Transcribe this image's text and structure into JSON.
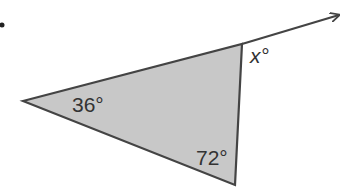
{
  "diagram": {
    "type": "triangle-exterior-angle",
    "fill_color": "#c8c8c8",
    "stroke_color": "#444444",
    "vertices": {
      "left": [
        23,
        101
      ],
      "top": [
        242,
        44
      ],
      "bottom": [
        235,
        185
      ]
    },
    "ray_tip": [
      340,
      15
    ],
    "labels": {
      "angle_left": "36°",
      "angle_bottom": "72°",
      "angle_exterior": "x°"
    }
  }
}
